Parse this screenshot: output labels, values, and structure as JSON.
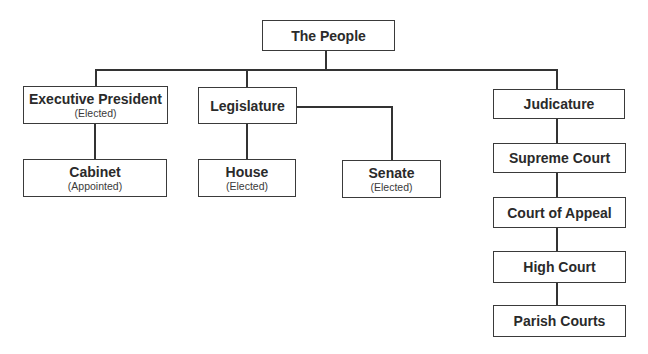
{
  "diagram": {
    "type": "org-chart",
    "nodes": {
      "people": {
        "label": "The People"
      },
      "executive": {
        "label": "Executive President",
        "note": "(Elected)"
      },
      "legislature": {
        "label": "Legislature"
      },
      "judicature": {
        "label": "Judicature"
      },
      "cabinet": {
        "label": "Cabinet",
        "note": "(Appointed)"
      },
      "house": {
        "label": "House",
        "note": "(Elected)"
      },
      "senate": {
        "label": "Senate",
        "note": "(Elected)"
      },
      "supreme": {
        "label": "Supreme Court"
      },
      "appeal": {
        "label": "Court of Appeal"
      },
      "high": {
        "label": "High Court"
      },
      "parish": {
        "label": "Parish Courts"
      }
    },
    "edges": [
      [
        "The People",
        "Executive President"
      ],
      [
        "The People",
        "Legislature"
      ],
      [
        "The People",
        "Judicature"
      ],
      [
        "Executive President",
        "Cabinet"
      ],
      [
        "Legislature",
        "House"
      ],
      [
        "Legislature",
        "Senate"
      ],
      [
        "Judicature",
        "Supreme Court"
      ],
      [
        "Supreme Court",
        "Court of Appeal"
      ],
      [
        "Court of Appeal",
        "High Court"
      ],
      [
        "High Court",
        "Parish Courts"
      ]
    ],
    "colors": {
      "line": "#333333",
      "box_border": "#3a3a3a",
      "text": "#2a2a2a",
      "background": "#ffffff"
    }
  }
}
